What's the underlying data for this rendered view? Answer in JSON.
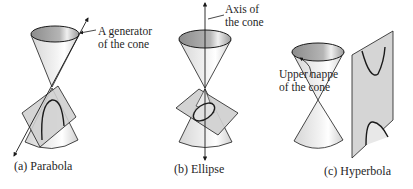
{
  "figure": {
    "panels": [
      {
        "id": "a",
        "caption": "(a) Parabola",
        "annotation": {
          "line1": "A generator",
          "line2": "of the cone"
        }
      },
      {
        "id": "b",
        "caption": "(b) Ellipse",
        "annotation": {
          "line1": "Axis of",
          "line2": "the cone"
        }
      },
      {
        "id": "c",
        "caption": "(c) Hyperbola",
        "annotation": {
          "line1": "Upper nappe",
          "line2": "of the cone"
        }
      }
    ]
  },
  "colors": {
    "stroke": "#1a1a1a",
    "cone_fill": "#e6e6e6",
    "cone_rim_inner": "#9a9a9a",
    "plane_fill": "#c9c9c9",
    "highlight": "#ffffff"
  }
}
